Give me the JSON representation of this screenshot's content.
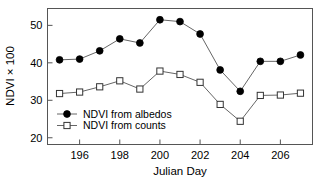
{
  "chart_data": {
    "type": "line",
    "title": "",
    "subtitle": "",
    "xlabel": "Julian Day",
    "ylabel": "NDVI × 100",
    "x": [
      195,
      196,
      197,
      198,
      199,
      200,
      201,
      202,
      203,
      204,
      205,
      206,
      207
    ],
    "xlim": [
      194.4,
      207.6
    ],
    "ylim": [
      18.2,
      54.5
    ],
    "xticks": [
      196,
      198,
      200,
      202,
      204,
      206
    ],
    "yticks": [
      20,
      30,
      40,
      50
    ],
    "xtick_labels": [
      "196",
      "198",
      "200",
      "202",
      "204",
      "206"
    ],
    "ytick_labels": [
      "20",
      "30",
      "40",
      "50"
    ],
    "grid": false,
    "legend_position": "lower left (inside axes)",
    "series": [
      {
        "name": "NDVI from albedos",
        "marker": "filled-circle",
        "color": "#000000",
        "values": [
          40.8,
          41.0,
          43.2,
          46.4,
          45.3,
          51.5,
          51.0,
          47.7,
          38.1,
          32.4,
          40.4,
          40.4,
          42.1
        ]
      },
      {
        "name": "NDVI from counts",
        "marker": "open-square",
        "color": "#000000",
        "values": [
          31.8,
          32.2,
          33.6,
          35.2,
          33.0,
          37.8,
          36.9,
          34.8,
          28.9,
          24.4,
          31.3,
          31.4,
          31.9
        ]
      }
    ]
  },
  "legend": {
    "items": [
      {
        "label": "NDVI from albedos",
        "marker": "filled-circle"
      },
      {
        "label": "NDVI from counts",
        "marker": "open-square"
      }
    ]
  },
  "axes": {
    "x_title": "Julian Day",
    "y_title": "NDVI × 100"
  },
  "style": {
    "frame_color": "#555555",
    "line_color": "#666666",
    "marker_fill": "#000000",
    "marker_open_fill": "#ffffff",
    "background": "#ffffff"
  }
}
